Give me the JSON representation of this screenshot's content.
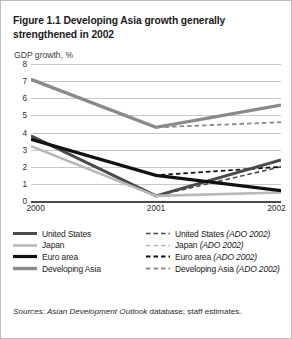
{
  "figure": {
    "title": "Figure 1.1  Developing Asia growth generally strengthened in 2002",
    "axis_note": "GDP growth, %",
    "sources_prefix": "Sources:",
    "sources_italic": " Asian Development Outlook ",
    "sources_rest": "database; staff estimates."
  },
  "colors": {
    "united_states": "#4a4a4a",
    "japan": "#b8b8b8",
    "euro_area": "#111111",
    "developing_asia": "#8a8a8a",
    "gridline": "#c9c9c9",
    "axis": "#4a4a4a",
    "border": "#bcbcbc",
    "text": "#1b1b1b"
  },
  "legend": {
    "rows": [
      {
        "left": {
          "label": "United States",
          "style": "solid",
          "color_key": "united_states",
          "width": 3.0,
          "name": "united-states"
        },
        "right": {
          "label": "United States",
          "suffix": "(ADO 2002)",
          "style": "dashed",
          "color_key": "united_states",
          "width": 1.6,
          "name": "united-states-ado-2002"
        }
      },
      {
        "left": {
          "label": "Japan",
          "style": "solid",
          "color_key": "japan",
          "width": 2.6,
          "name": "japan"
        },
        "right": {
          "label": "Japan",
          "suffix": "(ADO 2002)",
          "style": "dashed",
          "color_key": "japan",
          "width": 1.6,
          "name": "japan-ado-2002"
        }
      },
      {
        "left": {
          "label": "Euro area",
          "style": "solid",
          "color_key": "euro_area",
          "width": 3.2,
          "name": "euro-area"
        },
        "right": {
          "label": "Euro area",
          "suffix": "(ADO 2002)",
          "style": "dashed",
          "color_key": "euro_area",
          "width": 1.8,
          "name": "euro-area-ado-2002"
        }
      },
      {
        "left": {
          "label": "Developing Asia",
          "style": "solid",
          "color_key": "developing_asia",
          "width": 3.4,
          "name": "developing-asia"
        },
        "right": {
          "label": "Developing Asia",
          "suffix": "(ADO 2002)",
          "style": "dashed",
          "color_key": "developing_asia",
          "width": 1.8,
          "name": "developing-asia-ado-2002"
        }
      }
    ]
  },
  "chart_data": {
    "type": "line",
    "title": "Figure 1.1  Developing Asia growth generally strengthened in 2002",
    "xlabel": "",
    "ylabel": "GDP growth, %",
    "x": [
      "2000",
      "2001",
      "2002"
    ],
    "xlim": [
      2000,
      2002
    ],
    "ylim": [
      0,
      8
    ],
    "yticks": [
      0,
      1,
      2,
      3,
      4,
      5,
      6,
      7,
      8
    ],
    "grid": true,
    "legend_position": "bottom",
    "series": [
      {
        "name": "United States",
        "style": "solid",
        "color_key": "united_states",
        "width": 3.0,
        "values": [
          3.8,
          0.3,
          2.4
        ]
      },
      {
        "name": "Japan",
        "style": "solid",
        "color_key": "japan",
        "width": 2.6,
        "values": [
          3.2,
          0.3,
          0.5
        ]
      },
      {
        "name": "Euro area",
        "style": "solid",
        "color_key": "euro_area",
        "width": 3.2,
        "values": [
          3.6,
          1.5,
          0.6
        ]
      },
      {
        "name": "Developing Asia",
        "style": "solid",
        "color_key": "developing_asia",
        "width": 3.4,
        "values": [
          7.1,
          4.3,
          5.6
        ]
      },
      {
        "name": "United States (ADO 2002)",
        "style": "dashed",
        "color_key": "united_states",
        "width": 1.6,
        "values": [
          3.8,
          0.3,
          2.0
        ]
      },
      {
        "name": "Japan (ADO 2002)",
        "style": "dashed",
        "color_key": "japan",
        "width": 1.6,
        "values": [
          3.2,
          0.3,
          0.5
        ]
      },
      {
        "name": "Euro area (ADO 2002)",
        "style": "dashed",
        "color_key": "euro_area",
        "width": 1.8,
        "values": [
          3.6,
          1.5,
          2.0
        ]
      },
      {
        "name": "Developing Asia (ADO 2002)",
        "style": "dashed",
        "color_key": "developing_asia",
        "width": 1.8,
        "values": [
          7.1,
          4.3,
          4.6
        ]
      }
    ]
  }
}
